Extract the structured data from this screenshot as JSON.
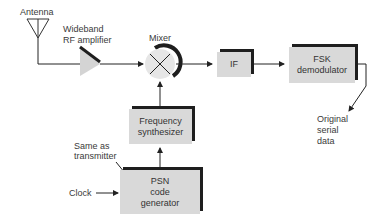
{
  "diagram": {
    "labels": {
      "antenna": "Antenna",
      "amplifier_line1": "Wideband",
      "amplifier_line2": "RF amplifier",
      "mixer": "Mixer",
      "same_as_line1": "Same as",
      "same_as_line2": "transmitter",
      "clock": "Clock",
      "output_line1": "Original",
      "output_line2": "serial",
      "output_line3": "data"
    },
    "blocks": {
      "if": {
        "line1": "IF"
      },
      "fsk": {
        "line1": "FSK",
        "line2": "demodulator"
      },
      "synth": {
        "line1": "Frequency",
        "line2": "synthesizer"
      },
      "psn": {
        "line1": "PSN",
        "line2": "code",
        "line3": "generator"
      }
    },
    "colors": {
      "block_fill": "#d9d9d9",
      "block_shadow": "#1e1e1e",
      "line": "#222222",
      "mixer_fill": "#e6e6e6"
    }
  }
}
